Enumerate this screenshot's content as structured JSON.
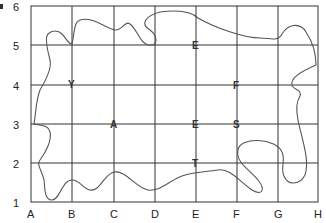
{
  "diagram": {
    "type": "grid-map",
    "columns": [
      "A",
      "B",
      "C",
      "D",
      "E",
      "F",
      "G",
      "H"
    ],
    "rows": [
      "6",
      "5",
      "4",
      "3",
      "2",
      "1"
    ],
    "markers": [
      {
        "label": "E",
        "col": "E",
        "row": "5"
      },
      {
        "label": "F",
        "col": "F",
        "row": "4"
      },
      {
        "label": "A",
        "col": "C",
        "row": "3"
      },
      {
        "label": "E",
        "col": "E",
        "row": "3"
      },
      {
        "label": "S",
        "col": "F",
        "row": "3"
      },
      {
        "label": "T",
        "col": "E",
        "row": "2"
      },
      {
        "label": "Y",
        "col": "B",
        "row": "4"
      }
    ],
    "outline": "island-shape",
    "colors": {
      "grid": "#333333",
      "outline": "#555555",
      "text": "#222222"
    }
  }
}
